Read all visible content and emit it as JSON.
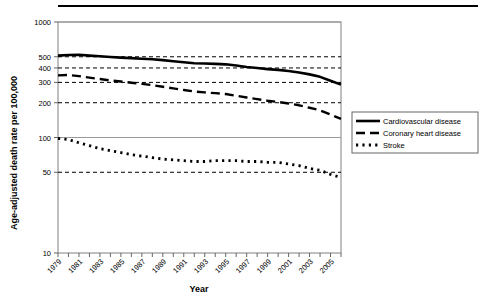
{
  "chart_data": {
    "type": "line",
    "title": "",
    "xlabel": "Year",
    "ylabel": "Age-adjusted death rate per 100,000",
    "yscale": "log",
    "ylim": [
      10,
      1000
    ],
    "ytick_values": [
      1000,
      500,
      400,
      300,
      200,
      100,
      50,
      10
    ],
    "ytick_labels": [
      "1000",
      "500",
      "400",
      "300",
      "200",
      "100",
      "50",
      "10"
    ],
    "gridlines": {
      "horizontal_dashed_at": [
        500,
        400,
        300,
        200,
        50
      ],
      "solid_at": [
        1000,
        100
      ],
      "vertical": false
    },
    "x": [
      1979,
      1980,
      1981,
      1982,
      1983,
      1984,
      1985,
      1986,
      1987,
      1988,
      1989,
      1990,
      1991,
      1992,
      1993,
      1994,
      1995,
      1996,
      1997,
      1998,
      1999,
      2000,
      2001,
      2002,
      2003,
      2004,
      2005,
      2006
    ],
    "xtick_labels": [
      "1979",
      "",
      "1981",
      "",
      "1983",
      "",
      "1985",
      "",
      "1987",
      "",
      "1989",
      "",
      "1991",
      "",
      "1993",
      "",
      "1995",
      "",
      "1997",
      "",
      "1999",
      "",
      "2001",
      "",
      "2003",
      "",
      "2005",
      ""
    ],
    "xlim": [
      1979,
      2006
    ],
    "legend_position": "right-outside",
    "series": [
      {
        "name": "Cardiovascular disease",
        "style": "solid",
        "values": [
          512,
          518,
          520,
          512,
          505,
          498,
          492,
          487,
          481,
          476,
          468,
          458,
          448,
          440,
          437,
          434,
          430,
          420,
          408,
          400,
          391,
          385,
          377,
          366,
          352,
          335,
          310,
          287
        ]
      },
      {
        "name": "Coronary heart disease",
        "style": "dashed",
        "values": [
          345,
          348,
          340,
          330,
          321,
          312,
          305,
          298,
          291,
          284,
          275,
          266,
          258,
          250,
          246,
          242,
          238,
          230,
          222,
          215,
          208,
          203,
          197,
          190,
          181,
          172,
          158,
          145
        ]
      },
      {
        "name": "Stroke",
        "style": "dotted",
        "values": [
          98,
          96,
          90,
          85,
          80,
          77,
          74,
          71,
          69,
          67,
          65,
          64,
          63,
          62,
          62,
          63,
          63,
          63,
          62,
          62,
          61,
          61,
          59,
          57,
          54,
          52,
          48,
          45
        ]
      }
    ]
  },
  "legend": {
    "items": [
      {
        "label": "Cardiovascular disease"
      },
      {
        "label": "Coronary heart disease"
      },
      {
        "label": "Stroke"
      }
    ]
  },
  "colors": {
    "line": "#000000",
    "grid": "#000000",
    "frame": "#808080",
    "background": "#ffffff"
  }
}
